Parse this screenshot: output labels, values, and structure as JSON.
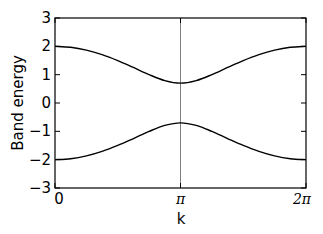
{
  "chart_data": {
    "type": "line",
    "title": "",
    "xlabel": "k",
    "ylabel": "Band energy",
    "xlim": [
      0,
      6.2832
    ],
    "ylim": [
      -3,
      3
    ],
    "grid": false,
    "legend": null,
    "x_ticks": [
      {
        "value": 0,
        "label": "0"
      },
      {
        "value": 3.1416,
        "label": "π"
      },
      {
        "value": 6.2832,
        "label": "2π"
      }
    ],
    "y_ticks": [
      {
        "value": 3,
        "label": "3"
      },
      {
        "value": 2,
        "label": "2"
      },
      {
        "value": 1,
        "label": "1"
      },
      {
        "value": 0,
        "label": "0"
      },
      {
        "value": -1,
        "label": "−1"
      },
      {
        "value": -2,
        "label": "−2"
      },
      {
        "value": -3,
        "label": "−3"
      }
    ],
    "vertical_lines": [
      {
        "x": 3.1416,
        "color": "#7f7f7f"
      }
    ],
    "x": [
      0,
      0.3927,
      0.7854,
      1.1781,
      1.5708,
      1.9635,
      2.3562,
      2.7489,
      3.1416,
      3.5343,
      3.927,
      4.3197,
      4.7124,
      5.1051,
      5.4978,
      5.8905,
      6.2832
    ],
    "series": [
      {
        "name": "upper band",
        "color": "#000000",
        "values": [
          2.0,
          1.966,
          1.867,
          1.708,
          1.498,
          1.254,
          1.002,
          0.79,
          0.7,
          0.79,
          1.002,
          1.254,
          1.498,
          1.708,
          1.867,
          1.966,
          2.0
        ]
      },
      {
        "name": "lower band",
        "color": "#000000",
        "values": [
          -2.0,
          -1.966,
          -1.867,
          -1.708,
          -1.498,
          -1.254,
          -1.002,
          -0.79,
          -0.7,
          -0.79,
          -1.002,
          -1.254,
          -1.498,
          -1.708,
          -1.867,
          -1.966,
          -2.0
        ]
      }
    ]
  }
}
